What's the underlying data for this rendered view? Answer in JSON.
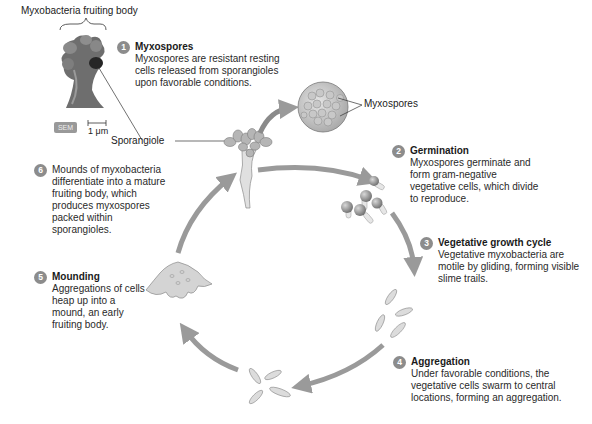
{
  "figure": {
    "title_label": "Myxobacteria fruiting body",
    "sem_badge": "SEM",
    "scale_bar": "1 μm",
    "sporangiole_label": "Sporangiole",
    "myxospores_label": "Myxospores",
    "accent_colors": {
      "arrow": "#9a9a9a",
      "badge": "#8c8c8c",
      "cell_fill": "#d8d8d8",
      "spore_fill": "#9e9e9e"
    }
  },
  "steps": [
    {
      "number": "1",
      "heading": "Myxospores",
      "body": "Myxospores are resistant resting cells released from sporangioles upon favorable conditions."
    },
    {
      "number": "2",
      "heading": "Germination",
      "body": "Myxospores germinate and form gram-negative vegetative cells, which divide to reproduce."
    },
    {
      "number": "3",
      "heading": "Vegetative growth cycle",
      "body": "Vegetative myxobacteria are motile by gliding, forming visible slime trails."
    },
    {
      "number": "4",
      "heading": "Aggregation",
      "body": "Under favorable conditions, the vegetative cells swarm to central locations, forming an aggregation."
    },
    {
      "number": "5",
      "heading": "Mounding",
      "body": "Aggregations of cells heap up into a mound, an early fruiting body."
    },
    {
      "number": "6",
      "heading": "",
      "body": "Mounds of myxobacteria differentiate into a mature fruiting body, which produces myxospores packed within sporangioles."
    }
  ]
}
